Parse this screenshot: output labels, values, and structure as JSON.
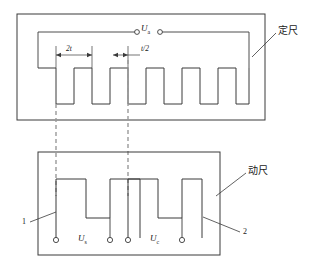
{
  "diagram": {
    "colors": {
      "line": "#3a3a3a",
      "dashed": "#9a9a9a",
      "background": "#ffffff",
      "text": "#1a1a1a"
    },
    "stator": {
      "name_label": "定尺",
      "excitation_terminal_label": "U",
      "excitation_terminal_sub": "a",
      "dimension_pitch_label": "2t",
      "dimension_gap_label": "t/2"
    },
    "slider": {
      "name_label": "动尺",
      "output_s_label": "U",
      "output_s_sub": "s",
      "output_c_label": "U",
      "output_c_sub": "c",
      "callout_1": "1",
      "callout_2": "2"
    }
  }
}
